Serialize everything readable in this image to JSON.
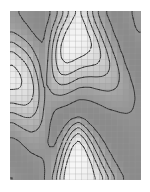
{
  "figure": {
    "title": "",
    "background_color": "#ffffff",
    "plot_background_color": "#f2f2f2"
  },
  "plot_area": {
    "left": 10,
    "top": 11,
    "width": 131,
    "height": 169,
    "label": "contour-heatmap-panel"
  },
  "style": {
    "grid_line_color": "#9a9a9a",
    "grid_line_width": 0.5,
    "contour_color": "#2b2b2b",
    "contour_line_width": 0.9,
    "contour_dash": "1.2,1.2",
    "colormap": "grayscale",
    "colormap_low": "#ffffff",
    "colormap_high": "#6e6e6e"
  },
  "chart_data": {
    "type": "heatmap",
    "title": "",
    "xlabel": "",
    "ylabel": "",
    "grid": true,
    "legend": "none",
    "ncols": 22,
    "nrows": 28,
    "xlim": [
      0,
      22
    ],
    "ylim": [
      0,
      28
    ],
    "zlim": [
      0,
      1
    ],
    "colorbar": false,
    "x_tick_labels": [],
    "y_tick_labels": [],
    "annotations": [],
    "contour_levels": [
      0.18,
      0.32,
      0.46,
      0.6,
      0.74,
      0.88
    ],
    "comment_shape": "nested chevron (V) ridges converging near column 11, with mirrored diagonal arcs sweeping from lower-left to upper-right",
    "values": [
      [
        0.72,
        0.74,
        0.76,
        0.78,
        0.8,
        0.8,
        0.76,
        0.66,
        0.52,
        0.36,
        0.22,
        0.14,
        0.24,
        0.4,
        0.56,
        0.68,
        0.76,
        0.8,
        0.8,
        0.78,
        0.74,
        0.7
      ],
      [
        0.7,
        0.72,
        0.75,
        0.78,
        0.8,
        0.8,
        0.74,
        0.62,
        0.46,
        0.3,
        0.17,
        0.11,
        0.2,
        0.35,
        0.51,
        0.64,
        0.73,
        0.79,
        0.8,
        0.78,
        0.75,
        0.71
      ],
      [
        0.66,
        0.69,
        0.72,
        0.76,
        0.79,
        0.79,
        0.71,
        0.56,
        0.38,
        0.22,
        0.12,
        0.09,
        0.15,
        0.29,
        0.45,
        0.59,
        0.7,
        0.77,
        0.8,
        0.79,
        0.76,
        0.72
      ],
      [
        0.6,
        0.64,
        0.68,
        0.73,
        0.77,
        0.78,
        0.68,
        0.5,
        0.3,
        0.16,
        0.09,
        0.08,
        0.12,
        0.23,
        0.38,
        0.53,
        0.66,
        0.75,
        0.79,
        0.8,
        0.78,
        0.74
      ],
      [
        0.52,
        0.57,
        0.62,
        0.68,
        0.74,
        0.76,
        0.65,
        0.44,
        0.24,
        0.11,
        0.07,
        0.07,
        0.1,
        0.18,
        0.31,
        0.47,
        0.61,
        0.72,
        0.78,
        0.8,
        0.79,
        0.76
      ],
      [
        0.43,
        0.49,
        0.55,
        0.62,
        0.7,
        0.74,
        0.62,
        0.39,
        0.19,
        0.09,
        0.07,
        0.08,
        0.11,
        0.16,
        0.26,
        0.41,
        0.56,
        0.68,
        0.76,
        0.8,
        0.8,
        0.78
      ],
      [
        0.34,
        0.4,
        0.47,
        0.56,
        0.66,
        0.72,
        0.6,
        0.36,
        0.17,
        0.09,
        0.09,
        0.11,
        0.14,
        0.18,
        0.24,
        0.36,
        0.5,
        0.64,
        0.74,
        0.79,
        0.8,
        0.79
      ],
      [
        0.26,
        0.32,
        0.39,
        0.49,
        0.61,
        0.7,
        0.59,
        0.35,
        0.18,
        0.12,
        0.13,
        0.16,
        0.19,
        0.22,
        0.26,
        0.34,
        0.46,
        0.59,
        0.7,
        0.78,
        0.8,
        0.8
      ],
      [
        0.2,
        0.25,
        0.32,
        0.42,
        0.56,
        0.68,
        0.58,
        0.36,
        0.21,
        0.17,
        0.19,
        0.23,
        0.26,
        0.28,
        0.3,
        0.35,
        0.43,
        0.55,
        0.67,
        0.76,
        0.8,
        0.8
      ],
      [
        0.16,
        0.2,
        0.26,
        0.36,
        0.51,
        0.66,
        0.58,
        0.38,
        0.26,
        0.23,
        0.26,
        0.31,
        0.34,
        0.35,
        0.36,
        0.39,
        0.44,
        0.53,
        0.63,
        0.73,
        0.79,
        0.8
      ],
      [
        0.14,
        0.17,
        0.22,
        0.31,
        0.46,
        0.64,
        0.58,
        0.42,
        0.32,
        0.31,
        0.35,
        0.4,
        0.42,
        0.43,
        0.43,
        0.44,
        0.47,
        0.53,
        0.61,
        0.7,
        0.77,
        0.8
      ],
      [
        0.14,
        0.16,
        0.2,
        0.28,
        0.42,
        0.62,
        0.59,
        0.47,
        0.4,
        0.4,
        0.44,
        0.49,
        0.51,
        0.51,
        0.5,
        0.5,
        0.51,
        0.55,
        0.61,
        0.68,
        0.75,
        0.79
      ],
      [
        0.16,
        0.17,
        0.2,
        0.26,
        0.39,
        0.6,
        0.6,
        0.52,
        0.48,
        0.49,
        0.53,
        0.58,
        0.59,
        0.59,
        0.57,
        0.56,
        0.56,
        0.58,
        0.62,
        0.67,
        0.73,
        0.78
      ],
      [
        0.2,
        0.2,
        0.22,
        0.27,
        0.38,
        0.59,
        0.62,
        0.58,
        0.56,
        0.58,
        0.62,
        0.66,
        0.67,
        0.66,
        0.64,
        0.62,
        0.61,
        0.62,
        0.64,
        0.68,
        0.72,
        0.77
      ],
      [
        0.26,
        0.25,
        0.26,
        0.3,
        0.39,
        0.58,
        0.64,
        0.64,
        0.64,
        0.66,
        0.7,
        0.73,
        0.73,
        0.72,
        0.7,
        0.68,
        0.66,
        0.66,
        0.67,
        0.69,
        0.72,
        0.76
      ],
      [
        0.34,
        0.32,
        0.31,
        0.34,
        0.42,
        0.58,
        0.66,
        0.7,
        0.71,
        0.73,
        0.76,
        0.78,
        0.78,
        0.77,
        0.75,
        0.73,
        0.71,
        0.7,
        0.7,
        0.71,
        0.73,
        0.76
      ],
      [
        0.43,
        0.4,
        0.38,
        0.39,
        0.46,
        0.59,
        0.68,
        0.74,
        0.77,
        0.79,
        0.8,
        0.8,
        0.8,
        0.8,
        0.79,
        0.77,
        0.75,
        0.74,
        0.73,
        0.73,
        0.74,
        0.76
      ],
      [
        0.52,
        0.48,
        0.45,
        0.45,
        0.5,
        0.6,
        0.7,
        0.77,
        0.8,
        0.8,
        0.78,
        0.75,
        0.78,
        0.8,
        0.8,
        0.8,
        0.79,
        0.77,
        0.76,
        0.75,
        0.75,
        0.76
      ],
      [
        0.6,
        0.56,
        0.52,
        0.51,
        0.54,
        0.62,
        0.72,
        0.79,
        0.8,
        0.76,
        0.66,
        0.58,
        0.68,
        0.77,
        0.8,
        0.8,
        0.8,
        0.79,
        0.78,
        0.77,
        0.76,
        0.76
      ],
      [
        0.67,
        0.63,
        0.59,
        0.57,
        0.59,
        0.64,
        0.73,
        0.8,
        0.78,
        0.68,
        0.52,
        0.42,
        0.54,
        0.68,
        0.77,
        0.8,
        0.8,
        0.8,
        0.79,
        0.78,
        0.77,
        0.77
      ],
      [
        0.72,
        0.69,
        0.65,
        0.62,
        0.63,
        0.67,
        0.74,
        0.79,
        0.73,
        0.58,
        0.38,
        0.28,
        0.4,
        0.57,
        0.7,
        0.78,
        0.8,
        0.8,
        0.8,
        0.79,
        0.78,
        0.77
      ],
      [
        0.76,
        0.74,
        0.7,
        0.67,
        0.67,
        0.69,
        0.75,
        0.77,
        0.67,
        0.47,
        0.26,
        0.17,
        0.28,
        0.46,
        0.62,
        0.73,
        0.79,
        0.8,
        0.8,
        0.8,
        0.78,
        0.77
      ],
      [
        0.78,
        0.77,
        0.74,
        0.71,
        0.7,
        0.71,
        0.74,
        0.74,
        0.6,
        0.37,
        0.17,
        0.11,
        0.19,
        0.36,
        0.54,
        0.68,
        0.76,
        0.8,
        0.8,
        0.8,
        0.79,
        0.78
      ],
      [
        0.8,
        0.79,
        0.77,
        0.74,
        0.73,
        0.73,
        0.73,
        0.7,
        0.53,
        0.28,
        0.11,
        0.07,
        0.13,
        0.27,
        0.45,
        0.61,
        0.72,
        0.78,
        0.8,
        0.8,
        0.79,
        0.78
      ],
      [
        0.8,
        0.8,
        0.79,
        0.77,
        0.75,
        0.74,
        0.72,
        0.66,
        0.46,
        0.21,
        0.08,
        0.06,
        0.09,
        0.2,
        0.37,
        0.54,
        0.67,
        0.75,
        0.79,
        0.8,
        0.8,
        0.79
      ],
      [
        0.79,
        0.8,
        0.8,
        0.79,
        0.77,
        0.75,
        0.71,
        0.62,
        0.4,
        0.16,
        0.06,
        0.06,
        0.08,
        0.15,
        0.29,
        0.46,
        0.61,
        0.71,
        0.77,
        0.8,
        0.8,
        0.79
      ],
      [
        0.77,
        0.79,
        0.8,
        0.8,
        0.78,
        0.76,
        0.7,
        0.58,
        0.34,
        0.12,
        0.06,
        0.07,
        0.09,
        0.13,
        0.23,
        0.38,
        0.54,
        0.66,
        0.74,
        0.79,
        0.8,
        0.8
      ],
      [
        0.74,
        0.77,
        0.79,
        0.8,
        0.79,
        0.76,
        0.69,
        0.54,
        0.29,
        0.1,
        0.07,
        0.09,
        0.11,
        0.14,
        0.19,
        0.31,
        0.46,
        0.6,
        0.7,
        0.77,
        0.8,
        0.8
      ]
    ]
  }
}
